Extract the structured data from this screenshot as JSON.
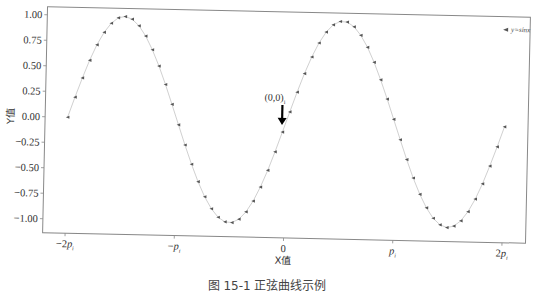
{
  "chart_data": {
    "type": "line",
    "title": "",
    "xlabel": "X值",
    "ylabel": "Y值",
    "xlim": [
      -6.6,
      6.6
    ],
    "ylim": [
      -1.1,
      1.05
    ],
    "grid": false,
    "legend_position": "upper right",
    "legend": [
      "y=sinx"
    ],
    "x_ticks": [
      -6.2832,
      -3.1416,
      0,
      3.1416,
      6.2832
    ],
    "x_tick_labels": [
      "-2p_i",
      "-p_i",
      "0",
      "p_i",
      "2p_i"
    ],
    "y_ticks": [
      1.0,
      0.75,
      0.5,
      0.25,
      0.0,
      -0.25,
      -0.5,
      -0.75,
      -1.0
    ],
    "y_tick_labels": [
      "1.00",
      "0.75",
      "0.50",
      "0.25",
      "0.00",
      "−0.25",
      "−0.50",
      "−0.75",
      "−1.00"
    ],
    "series": [
      {
        "name": "y=sinx",
        "function": "sin(x)",
        "x_start": -6.2832,
        "x_end": 6.2832,
        "num_points": 64,
        "marker": "<",
        "line_style": "solid",
        "color": "#555555"
      }
    ],
    "annotations": [
      {
        "text": "(0,0)",
        "subscript": "i",
        "xy": [
          0,
          0
        ],
        "arrow": "down",
        "arrow_color": "#000000"
      }
    ]
  },
  "caption": "图 15-1   正弦曲线示例",
  "colors": {
    "line": "#bbbbbb",
    "marker": "#555555",
    "frame": "#888888",
    "arrow": "#000000"
  }
}
